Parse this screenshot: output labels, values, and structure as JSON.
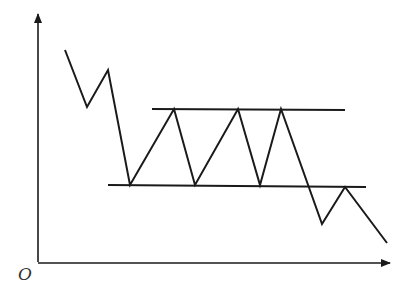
{
  "diagram": {
    "type": "price-pattern",
    "origin_label": "O",
    "stroke_color": "#1a1a1a",
    "axes": {
      "y_axis": {
        "x": 38,
        "y_top": 14,
        "y_bottom": 262
      },
      "x_axis": {
        "y": 263,
        "x_left": 38,
        "x_right": 390
      }
    },
    "resistance_line": {
      "x1": 152,
      "y1": 109,
      "x2": 345,
      "y2": 110
    },
    "support_line": {
      "x1": 108,
      "y1": 185,
      "x2": 366,
      "y2": 187
    },
    "price_path": [
      [
        65,
        50
      ],
      [
        87,
        107
      ],
      [
        108,
        70
      ],
      [
        130,
        185
      ],
      [
        174,
        109
      ],
      [
        195,
        185
      ],
      [
        238,
        109
      ],
      [
        260,
        185
      ],
      [
        281,
        109
      ],
      [
        322,
        224
      ],
      [
        345,
        187
      ],
      [
        387,
        243
      ]
    ]
  }
}
